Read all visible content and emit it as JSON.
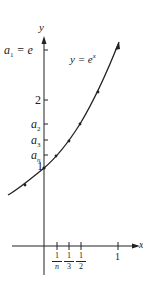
{
  "figure": {
    "function_label": "y = e",
    "function_exponent": "x",
    "axes": {
      "x_label": "x",
      "y_label": "y"
    },
    "y_ticks": [
      {
        "label": "a",
        "sub": "1",
        "suffix": " = e",
        "value": 2.718
      },
      {
        "label": "2",
        "value": 2
      },
      {
        "label": "a",
        "sub": "2",
        "value": 1.6487
      },
      {
        "label": "a",
        "sub": "3",
        "value": 1.3956
      },
      {
        "label": "a",
        "sub": "n",
        "value": 1.2
      },
      {
        "label": "1",
        "value": 1
      }
    ],
    "x_ticks": [
      {
        "num": "1",
        "den": "n",
        "value": 0.167
      },
      {
        "num": "1",
        "den": "3",
        "value": 0.333
      },
      {
        "num": "1",
        "den": "2",
        "value": 0.5
      },
      {
        "label": "1",
        "value": 1
      }
    ],
    "colors": {
      "ink": "#222222",
      "background": "#ffffff"
    }
  }
}
